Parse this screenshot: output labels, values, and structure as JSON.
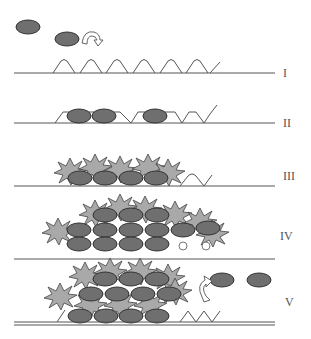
{
  "diagram": {
    "title": "",
    "colors": {
      "particle": "#6f6f6f",
      "particle_outline": "#333333",
      "aggregate": "#a9a9a9",
      "aggregate_outline": "#444444",
      "line": "#555555",
      "label": "#555555"
    },
    "stages": [
      {
        "id": "I",
        "label": "I"
      },
      {
        "id": "II",
        "label": "II"
      },
      {
        "id": "III",
        "label": "III"
      },
      {
        "id": "IV",
        "label": "IV"
      },
      {
        "id": "V",
        "label": "V"
      }
    ]
  }
}
